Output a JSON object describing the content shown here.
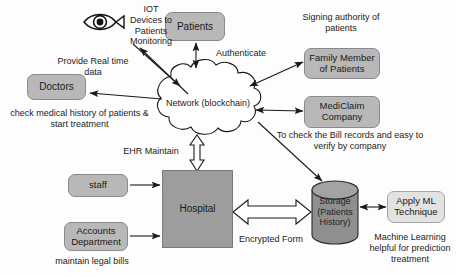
{
  "diagram": {
    "palette": {
      "node_fill": "#b8b8b8",
      "node_fill_light": "#e2e2e2",
      "hospital_fill": "#9d9d9d",
      "storage_fill": "#8f8f8f",
      "stroke": "#1a1a1a",
      "background": "#fdfdfd"
    }
  },
  "nodes": {
    "patients": {
      "label": "Patients"
    },
    "doctors": {
      "label": "Doctors"
    },
    "family_member": {
      "label": "Family Member\nof Patients",
      "line1": "Family Member",
      "line2": "of Patients"
    },
    "mediclaim": {
      "label": "MediClaim\nCompany",
      "line1": "MediClaim",
      "line2": "Company"
    },
    "network": {
      "label": "Network (blockchain)"
    },
    "staff": {
      "label": "staff"
    },
    "accounts": {
      "line1": "Accounts",
      "line2": "Department"
    },
    "hospital": {
      "label": "Hospital"
    },
    "storage": {
      "line1": "Storage",
      "line2": "(Patients",
      "line3": "History)"
    },
    "apply_ml": {
      "line1": "Apply ML",
      "line2": "Technique"
    }
  },
  "icons": {
    "eye": "eye-icon"
  },
  "captions": {
    "iot": {
      "line1": "IOT",
      "line2": "Devices to",
      "line3": "Patients",
      "line4": "Monitoring"
    },
    "provide_realtime": {
      "line1": "Provide Real time",
      "line2": "data"
    },
    "authenticate": {
      "text": "Authenticate"
    },
    "signing_authority": {
      "line1": "Signing authority of",
      "line2": "patients"
    },
    "bill_records": {
      "line1": "To check the Bill records and easy to",
      "line2": "verify by company"
    },
    "check_medical": {
      "line1": "check medical history of patients &",
      "line2": "start treatment"
    },
    "ehr_maintain": {
      "text": "EHR Maintain"
    },
    "maintain_legal_bills": {
      "text": "maintain legal bills"
    },
    "encrypted_form": {
      "text": "Encrypted Form"
    },
    "machine_learning": {
      "line1": "Machine Learning",
      "line2": "helpful for prediction",
      "line3": "treatment"
    }
  }
}
